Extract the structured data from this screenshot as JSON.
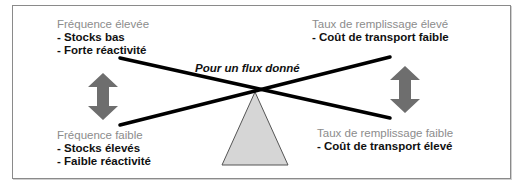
{
  "diagram": {
    "center_label": "Pour un flux donné",
    "top_left": {
      "heading": "Fréquence élevée",
      "items": [
        "- Stocks bas",
        "- Forte réactivité"
      ]
    },
    "bottom_left": {
      "heading": "Fréquence faible",
      "items": [
        "- Stocks élevés",
        "- Faible réactivité"
      ]
    },
    "top_right": {
      "heading": "Taux de remplissage élevé",
      "items": [
        "- Coût de transport faible"
      ]
    },
    "bottom_right": {
      "heading": "Taux de remplissage faible",
      "items": [
        "- Coût de transport élevé"
      ]
    },
    "icons": {
      "left_arrow": "double-vertical-arrow-icon",
      "right_arrow": "double-vertical-arrow-icon",
      "fulcrum": "triangle-fulcrum-icon"
    },
    "colors": {
      "heading_text": "#8c8c8c",
      "item_text": "#111111",
      "lines": "#000000",
      "arrows": "#6e6e6e",
      "fulcrum_fill": "#d6d6d6",
      "fulcrum_stroke": "#555555",
      "frame_border": "#8a8a8a"
    }
  }
}
